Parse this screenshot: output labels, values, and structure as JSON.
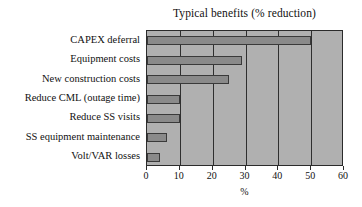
{
  "chart_data": {
    "type": "bar",
    "orientation": "horizontal",
    "title": "Typical benefits (% reduction)",
    "xlabel": "%",
    "ylabel": "",
    "xlim": [
      0,
      60
    ],
    "xticks": [
      0,
      10,
      20,
      30,
      40,
      50,
      60
    ],
    "grid": true,
    "legend": null,
    "categories": [
      "CAPEX deferral",
      "Equipment costs",
      "New construction costs",
      "Reduce CML (outage time)",
      "Reduce SS visits",
      "SS equipment maintenance",
      "Volt/VAR losses"
    ],
    "values": [
      50,
      29,
      25,
      10,
      10,
      6,
      4
    ],
    "colors": {
      "bar_fill": "#8a8a8a",
      "bar_edge": "#3a3a3a",
      "plot_background": "#b0b0b0",
      "page_background": "#ffffff",
      "axis": "#2b2b2b",
      "gridline": "#2f2f2f",
      "text": "#111111"
    }
  }
}
